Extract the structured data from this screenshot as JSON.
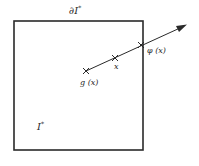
{
  "figure": {
    "colors": {
      "ink": "#2a2a2a",
      "background": "#ffffff"
    },
    "region": {
      "label": "I",
      "superscript": "*"
    },
    "boundary": {
      "label": "∂I",
      "superscript": "*"
    },
    "points": [
      {
        "id": "g_x",
        "label": "g (x)",
        "marker": "cross-icon"
      },
      {
        "id": "x",
        "label": "x",
        "marker": "cross-icon"
      },
      {
        "id": "phi_x",
        "label": "φ (x)",
        "marker": "cross-icon"
      }
    ],
    "ray": {
      "from": "g(x)",
      "through": "x",
      "hits_boundary_at": "φ(x)",
      "arrowhead": "arrow-icon"
    }
  }
}
